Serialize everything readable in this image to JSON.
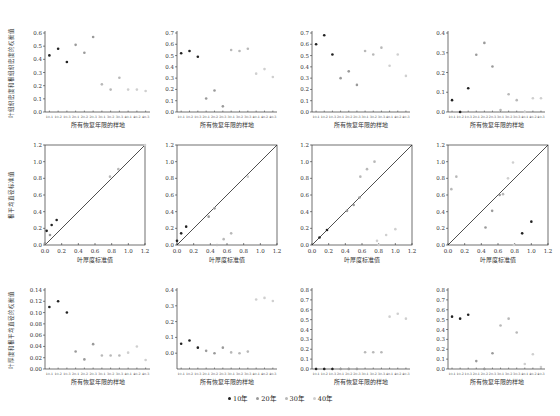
{
  "legend": [
    {
      "label": "10年",
      "color": "#222222"
    },
    {
      "label": "20年",
      "color": "#9a9a9a"
    },
    {
      "label": "30年",
      "color": "#b8b8b8"
    },
    {
      "label": "40年",
      "color": "#cfcfcf"
    }
  ],
  "sample_categories": [
    "10-1",
    "10-2",
    "10-3",
    "20-1",
    "20-2",
    "20-3",
    "30-1",
    "30-2",
    "30-3",
    "40-1",
    "40-2",
    "40-3"
  ],
  "rows": {
    "top": {
      "ylabel": "叶组织密度和根组织密度的权衡值",
      "xlabel": "所有恢复年限的样地"
    },
    "middle": {
      "ylabel": "根平均直径标准值",
      "xlabel": "叶厚度标准值"
    },
    "bottom": {
      "ylabel": "叶厚度和根平均直径的权衡值",
      "xlabel": "所有恢复年限的样地"
    }
  },
  "chart_data": [
    {
      "type": "scatter",
      "panel": "row1-col1",
      "title": "",
      "xlabel": "所有恢复年限的样地",
      "ylabel": "叶组织密度和根组织密度的权衡值",
      "categories": [
        "10-1",
        "10-2",
        "10-3",
        "20-1",
        "20-2",
        "20-3",
        "30-1",
        "30-2",
        "30-3",
        "40-1",
        "40-2",
        "40-3"
      ],
      "values": [
        0.43,
        0.48,
        0.38,
        0.51,
        0.45,
        0.57,
        0.21,
        0.17,
        0.26,
        0.17,
        0.17,
        0.16
      ],
      "yticks": [
        0.0,
        0.1,
        0.2,
        0.3,
        0.4,
        0.5,
        0.6
      ],
      "ylim": [
        0,
        0.6
      ]
    },
    {
      "type": "scatter",
      "panel": "row1-col2",
      "title": "",
      "xlabel": "所有恢复年限的样地",
      "ylabel": "",
      "categories": [
        "10-1",
        "10-2",
        "10-3",
        "20-1",
        "20-2",
        "20-3",
        "30-1",
        "30-2",
        "30-3",
        "40-1",
        "40-2",
        "40-3"
      ],
      "values": [
        0.52,
        0.54,
        0.49,
        0.12,
        0.19,
        0.05,
        0.55,
        0.54,
        0.56,
        0.34,
        0.38,
        0.31
      ],
      "yticks": [
        0.0,
        0.1,
        0.2,
        0.3,
        0.4,
        0.5,
        0.6,
        0.7
      ],
      "ylim": [
        0,
        0.7
      ]
    },
    {
      "type": "scatter",
      "panel": "row1-col3",
      "title": "",
      "xlabel": "所有恢复年限的样地",
      "ylabel": "",
      "categories": [
        "10-1",
        "10-2",
        "10-3",
        "20-1",
        "20-2",
        "20-3",
        "30-1",
        "30-2",
        "30-3",
        "40-1",
        "40-2",
        "40-3"
      ],
      "values": [
        0.6,
        0.68,
        0.51,
        0.3,
        0.36,
        0.24,
        0.54,
        0.51,
        0.57,
        0.41,
        0.51,
        0.32
      ],
      "yticks": [
        0.0,
        0.1,
        0.2,
        0.3,
        0.4,
        0.5,
        0.6,
        0.7
      ],
      "ylim": [
        0,
        0.7
      ]
    },
    {
      "type": "scatter",
      "panel": "row1-col4",
      "title": "",
      "xlabel": "所有恢复年限的样地",
      "ylabel": "",
      "categories": [
        "10-1",
        "10-2",
        "10-3",
        "20-1",
        "20-2",
        "20-3",
        "30-1",
        "30-2",
        "30-3",
        "40-1",
        "40-2",
        "40-3"
      ],
      "values": [
        0.06,
        0.0,
        0.12,
        0.29,
        0.35,
        0.23,
        0.01,
        0.09,
        0.06,
        0.0,
        0.07,
        0.07
      ],
      "yticks": [
        0.0,
        0.1,
        0.2,
        0.3,
        0.4
      ],
      "ylim": [
        0,
        0.4
      ]
    },
    {
      "type": "scatter",
      "panel": "row2-col1",
      "title": "",
      "xlabel": "叶厚度标准值",
      "ylabel": "根平均直径标准值",
      "x": [
        0.02,
        0.08,
        0.14,
        0.0,
        0.06,
        0.78,
        0.88,
        1.2
      ],
      "y": [
        0.17,
        0.24,
        0.3,
        0.02,
        0.12,
        0.82,
        0.91,
        1.2
      ],
      "series_years": [
        "10年",
        "10年",
        "10年",
        "20年",
        "20年",
        "30年",
        "30年",
        "40年"
      ],
      "reference_line": "y = x",
      "xlim": [
        0,
        1.2
      ],
      "ylim": [
        0,
        1.2
      ],
      "xticks": [
        0.0,
        0.2,
        0.4,
        0.6,
        0.8,
        1.0,
        1.2
      ],
      "yticks": [
        0.0,
        0.2,
        0.4,
        0.6,
        0.8,
        1.0,
        1.2
      ]
    },
    {
      "type": "scatter",
      "panel": "row2-col2",
      "title": "",
      "xlabel": "叶厚度标准值",
      "ylabel": "",
      "x": [
        0.0,
        0.05,
        0.11,
        0.38,
        0.45,
        0.56,
        0.65,
        0.85,
        0.48
      ],
      "y": [
        0.05,
        0.14,
        0.22,
        0.34,
        0.44,
        0.07,
        0.14,
        0.82,
        0.0
      ],
      "series_years": [
        "10年",
        "10年",
        "10年",
        "20年",
        "20年",
        "30年",
        "30年",
        "40年",
        "30年"
      ],
      "reference_line": "y = x",
      "xlim": [
        0,
        1.2
      ],
      "ylim": [
        0,
        1.2
      ],
      "xticks": [
        0.0,
        0.2,
        0.4,
        0.6,
        0.8,
        1.0,
        1.2
      ],
      "yticks": [
        0.0,
        0.2,
        0.4,
        0.6,
        0.8,
        1.0,
        1.2
      ]
    },
    {
      "type": "scatter",
      "panel": "row2-col3",
      "title": "",
      "xlabel": "叶厚度标准值",
      "ylabel": "",
      "x": [
        0.09,
        0.18,
        0.42,
        0.5,
        0.57,
        0.58,
        0.66,
        0.75,
        0.78,
        0.89,
        1.0,
        0.8
      ],
      "y": [
        0.09,
        0.18,
        0.41,
        0.48,
        0.57,
        0.82,
        0.91,
        1.0,
        0.05,
        0.12,
        0.19,
        0.0
      ],
      "series_years": [
        "10年",
        "10年",
        "20年",
        "20年",
        "20年",
        "30年",
        "30年",
        "30年",
        "40年",
        "40年",
        "40年",
        "40年"
      ],
      "reference_line": "y = x",
      "xlim": [
        0,
        1.2
      ],
      "ylim": [
        0,
        1.2
      ],
      "xticks": [
        0.0,
        0.2,
        0.4,
        0.6,
        0.8,
        1.0,
        1.2
      ],
      "yticks": [
        0.0,
        0.2,
        0.4,
        0.6,
        0.8,
        1.0,
        1.2
      ]
    },
    {
      "type": "scatter",
      "panel": "row2-col4",
      "title": "",
      "xlabel": "叶厚度标准值",
      "ylabel": "",
      "x": [
        0.04,
        0.1,
        0.45,
        0.53,
        0.62,
        0.66,
        0.72,
        0.78,
        0.89,
        1.0,
        0.79
      ],
      "y": [
        0.67,
        0.82,
        0.21,
        0.41,
        0.6,
        0.61,
        0.8,
        0.99,
        0.14,
        0.28,
        0.0
      ],
      "series_years": [
        "30年",
        "30年",
        "20年",
        "20年",
        "20年",
        "30年",
        "40年",
        "40年",
        "10年",
        "10年",
        "40年"
      ],
      "reference_line": "y = x",
      "xlim": [
        0,
        1.2
      ],
      "ylim": [
        0,
        1.2
      ],
      "xticks": [
        0.0,
        0.2,
        0.4,
        0.6,
        0.8,
        1.0,
        1.2
      ],
      "yticks": [
        0.0,
        0.2,
        0.4,
        0.6,
        0.8,
        1.0,
        1.2
      ]
    },
    {
      "type": "scatter",
      "panel": "row3-col1",
      "title": "",
      "xlabel": "所有恢复年限的样地",
      "ylabel": "叶厚度和根平均直径的权衡值",
      "categories": [
        "10-1",
        "10-2",
        "10-3",
        "20-1",
        "20-2",
        "20-3",
        "30-1",
        "30-2",
        "30-3",
        "40-1",
        "40-2",
        "40-3"
      ],
      "values": [
        0.11,
        0.12,
        0.1,
        0.031,
        0.017,
        0.044,
        0.024,
        0.024,
        0.024,
        0.029,
        0.04,
        0.016
      ],
      "yticks": [
        0.0,
        0.02,
        0.04,
        0.06,
        0.08,
        0.1,
        0.12,
        0.14
      ],
      "ylim": [
        0,
        0.14
      ]
    },
    {
      "type": "scatter",
      "panel": "row3-col2",
      "title": "",
      "xlabel": "所有恢复年限的样地",
      "ylabel": "",
      "categories": [
        "10-1",
        "10-2",
        "10-3",
        "20-1",
        "20-2",
        "20-3",
        "30-1",
        "30-2",
        "30-3",
        "40-1",
        "40-2",
        "40-3"
      ],
      "values": [
        0.06,
        0.08,
        0.035,
        0.015,
        0.0,
        0.035,
        0.005,
        0.0,
        0.01,
        0.34,
        0.35,
        0.33
      ],
      "yticks": [
        0.0,
        0.1,
        0.2,
        0.3,
        0.4
      ],
      "ylim": [
        -0.1,
        0.4
      ]
    },
    {
      "type": "scatter",
      "panel": "row3-col3",
      "title": "",
      "xlabel": "所有恢复年限的样地",
      "ylabel": "",
      "categories": [
        "10-1",
        "10-2",
        "10-3",
        "20-1",
        "20-2",
        "20-3",
        "30-1",
        "30-2",
        "30-3",
        "40-1",
        "40-2",
        "40-3"
      ],
      "values": [
        0.0,
        0.0,
        0.0,
        0.0,
        0.0,
        0.0,
        0.17,
        0.17,
        0.17,
        0.53,
        0.56,
        0.51
      ],
      "yticks": [
        0.0,
        0.1,
        0.2,
        0.3,
        0.4,
        0.5,
        0.6,
        0.7,
        0.8
      ],
      "ylim": [
        0,
        0.8
      ]
    },
    {
      "type": "scatter",
      "panel": "row3-col4",
      "title": "",
      "xlabel": "所有恢复年限的样地",
      "ylabel": "",
      "categories": [
        "10-1",
        "10-2",
        "10-3",
        "20-1",
        "20-2",
        "20-3",
        "30-1",
        "30-2",
        "30-3",
        "40-1",
        "40-2",
        "40-3"
      ],
      "values": [
        0.53,
        0.51,
        0.55,
        0.08,
        0.0,
        0.16,
        0.44,
        0.51,
        0.37,
        0.05,
        0.15,
        0.02
      ],
      "yticks": [
        0.0,
        0.1,
        0.2,
        0.3,
        0.4,
        0.5,
        0.6,
        0.7,
        0.8
      ],
      "ylim": [
        0,
        0.8
      ]
    }
  ]
}
